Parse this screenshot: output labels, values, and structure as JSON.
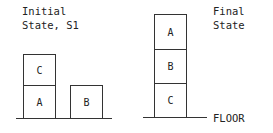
{
  "initial_state": {
    "title_line1": "Initial",
    "title_line2": "State, S1",
    "blocks": {
      "top_left": "C",
      "bottom_left": "A",
      "bottom_right": "B"
    }
  },
  "final_state": {
    "title_line1": "Final",
    "title_line2": "State",
    "blocks": {
      "top": "A",
      "middle": "B",
      "bottom": "C"
    },
    "floor_label": "FLOOR"
  }
}
